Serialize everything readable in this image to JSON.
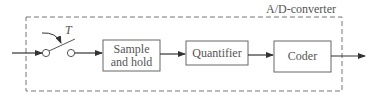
{
  "diagram": {
    "container_label": "A/D-converter",
    "switch_label": "T",
    "blocks": [
      {
        "id": "sample-hold",
        "lines": [
          "Sample",
          "and hold"
        ]
      },
      {
        "id": "quantifier",
        "lines": [
          "Quantifier"
        ]
      },
      {
        "id": "coder",
        "lines": [
          "Coder"
        ]
      }
    ],
    "colors": {
      "stroke": "#555555",
      "dashed": "#777777",
      "background": "#ffffff"
    }
  }
}
